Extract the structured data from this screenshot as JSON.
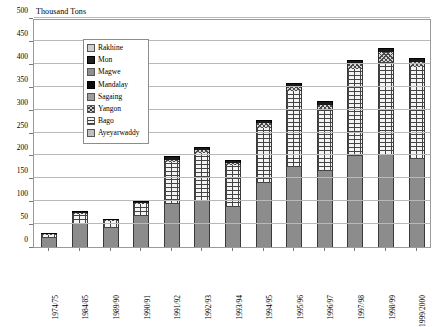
{
  "chart_data": {
    "type": "bar",
    "subtype": "stacked-column",
    "title": "",
    "axis_note": "Thousand Tons",
    "xlabel": "",
    "ylabel": "Thousand Tons",
    "ylim": [
      0,
      500
    ],
    "ytick_step": 50,
    "yticks": [
      0,
      50,
      100,
      150,
      200,
      250,
      300,
      350,
      400,
      450,
      500
    ],
    "grid": true,
    "legend_position": "upper-left-inside",
    "categories": [
      "1974/75",
      "1984/85",
      "1989/90",
      "1990/91",
      "1991/92",
      "1992/93",
      "1993/94",
      "1994/95",
      "1995/96",
      "1996/97",
      "1997/98",
      "1998/99",
      "1999/2000"
    ],
    "series": [
      {
        "name": "Ayeyarwaddy",
        "pattern": "solid-gray",
        "values": [
          20,
          50,
          42,
          68,
          95,
          100,
          88,
          140,
          175,
          165,
          198,
          200,
          192
        ]
      },
      {
        "name": "Bago",
        "pattern": "brick",
        "values": [
          6,
          22,
          14,
          26,
          90,
          105,
          90,
          120,
          165,
          135,
          190,
          205,
          200
        ]
      },
      {
        "name": "Yangon",
        "pattern": "crosshatch",
        "values": [
          1,
          3,
          2,
          3,
          6,
          6,
          6,
          10,
          10,
          10,
          12,
          20,
          12
        ]
      },
      {
        "name": "Sagaing",
        "pattern": "solid-gray-mid",
        "values": [
          0,
          0,
          0,
          0,
          0,
          0,
          0,
          0,
          0,
          0,
          0,
          0,
          0
        ]
      },
      {
        "name": "Mandalay",
        "pattern": "black",
        "values": [
          1,
          3,
          2,
          3,
          7,
          7,
          6,
          8,
          8,
          8,
          8,
          10,
          9
        ]
      },
      {
        "name": "Magwe",
        "pattern": "solid-gray-light",
        "values": [
          0,
          0,
          0,
          0,
          0,
          0,
          0,
          0,
          0,
          0,
          0,
          0,
          0
        ]
      },
      {
        "name": "Mon",
        "pattern": "black-solid",
        "values": [
          0,
          0,
          0,
          0,
          0,
          0,
          0,
          0,
          0,
          0,
          0,
          0,
          0
        ]
      },
      {
        "name": "Rakhine",
        "pattern": "light-gray",
        "values": [
          0,
          0,
          0,
          0,
          0,
          0,
          0,
          0,
          0,
          0,
          0,
          0,
          0
        ]
      }
    ],
    "totals": [
      28,
      78,
      60,
      100,
      198,
      218,
      190,
      278,
      358,
      318,
      408,
      435,
      413
    ]
  },
  "legend": {
    "items": [
      {
        "label": "Rakhine",
        "swatch": "rakhine-swatch"
      },
      {
        "label": "Mon",
        "swatch": "mon-swatch"
      },
      {
        "label": "Magwe",
        "swatch": "magwe-swatch"
      },
      {
        "label": "Mandalay",
        "swatch": "mandalay-swatch"
      },
      {
        "label": "Sagaing",
        "swatch": "sagaing-swatch"
      },
      {
        "label": "Yangon",
        "swatch": "yangon-swatch"
      },
      {
        "label": "Bago",
        "swatch": "bago-swatch"
      },
      {
        "label": "Ayeyarwaddy",
        "swatch": "ayeyarwaddy-swatch"
      }
    ]
  },
  "colors": {
    "grid": "#b9b9b9",
    "frame": "#9a9a9a",
    "bar_gray": "#8c8c8c",
    "bar_black": "#1a1a1a",
    "background": "#ffffff"
  }
}
